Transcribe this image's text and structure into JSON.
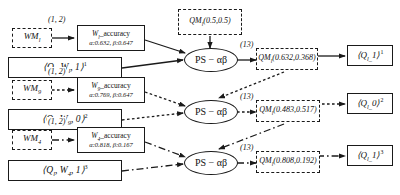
{
  "figure": {
    "type": "flow-diagram",
    "rows": [
      {
        "index": 1,
        "wm_node": "WM",
        "wm_sub": "l",
        "wm_edge_label": "(1, 2)",
        "accuracy_title_prefix": "W",
        "accuracy_title_sub": "l",
        "accuracy_title_suffix": "_accuracy",
        "accuracy_params": "α:0.632, β:0.647",
        "query_node": "⟨Q",
        "query_sub": "l",
        "query_mid": ", W",
        "query_mid_sub": "l",
        "query_tail": ", 1⟩",
        "query_sup": "1",
        "ps_node": "PS − αβ",
        "ps_edge_label": "(13)",
        "qm_prefix": "QM",
        "qm_sub": "l",
        "qm_values": "(0.632,0.368)",
        "out_prefix": "⟨Q",
        "out_sub": "l_",
        "out_value": "1⟩",
        "out_sup": "1",
        "line_style": "solid"
      },
      {
        "index": 2,
        "wm_node": "WM",
        "wm_sub": "9",
        "wm_edge_label": "(1, 2)",
        "accuracy_title_prefix": "W",
        "accuracy_title_sub": "9",
        "accuracy_title_suffix": "_accuracy",
        "accuracy_params": "α:0.769, β:0.647",
        "query_node": "⟨Q",
        "query_sub": "l",
        "query_mid": ", W",
        "query_mid_sub": "9",
        "query_tail": ", 0⟩",
        "query_sup": "2",
        "ps_node": "PS − αβ",
        "ps_edge_label": "(13)",
        "qm_prefix": "QM",
        "qm_sub": "l",
        "qm_values": "(0.483,0.517)",
        "out_prefix": "⟨Q",
        "out_sub": "l_",
        "out_value": "0⟩",
        "out_sup": "2",
        "line_style": "dotted"
      },
      {
        "index": 3,
        "wm_node": "WM",
        "wm_sub": "4",
        "wm_edge_label": "(1, 2)",
        "accuracy_title_prefix": "W",
        "accuracy_title_sub": "4",
        "accuracy_title_suffix": "_accuracy",
        "accuracy_params": "α:0.818, β:0.167",
        "query_node": "⟨Q",
        "query_sub": "l",
        "query_mid": ", W",
        "query_mid_sub": "4",
        "query_tail": ", 1⟩",
        "query_sup": "3",
        "ps_node": "PS − αβ",
        "ps_edge_label": "(13)",
        "qm_prefix": "QM",
        "qm_sub": "l",
        "qm_values": "(0.808,0.192)",
        "out_prefix": "⟨Q",
        "out_sub": "l_",
        "out_value": "1⟩",
        "out_sup": "3",
        "line_style": "dashdot"
      }
    ],
    "prior": {
      "prefix": "QM",
      "sub": "l",
      "values": "(0.5,0.5)"
    },
    "colors": {
      "stroke": "#1a1a1a",
      "background": "#ffffff"
    }
  }
}
